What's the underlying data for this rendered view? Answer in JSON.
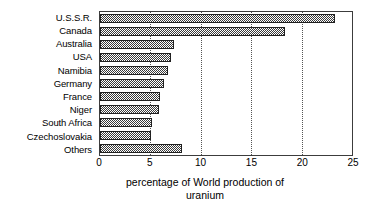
{
  "chart_data": {
    "type": "bar",
    "orientation": "horizontal",
    "title": "",
    "xlabel": "percentage of World production of uranium",
    "ylabel": "",
    "categories": [
      "U.S.S.R.",
      "Canada",
      "Australia",
      "USA",
      "Namibia",
      "Germany",
      "France",
      "Niger",
      "South Africa",
      "Czechoslovakia",
      "Others"
    ],
    "values": [
      23.3,
      18.4,
      7.3,
      7.0,
      6.7,
      6.3,
      6.0,
      5.9,
      5.2,
      5.1,
      8.1
    ],
    "xlim": [
      0,
      25
    ],
    "xticks": [
      0,
      5,
      10,
      15,
      20,
      25
    ],
    "xtick_labels": [
      "0",
      "5",
      "10",
      "15",
      "20",
      "25"
    ],
    "grid": "vertical-dotted-at-xticks",
    "legend": "none",
    "bar_fill": "dark-gray-checkerboard",
    "colors": {
      "bar_fill": "#3a3a3a",
      "bar_edge": "#202020",
      "frame": "#3c3c3c",
      "gridline": "#555555",
      "background": "#ffffff",
      "text": "#000000"
    }
  },
  "axis_title_lines": [
    "percentage of World production of",
    "uranium"
  ]
}
